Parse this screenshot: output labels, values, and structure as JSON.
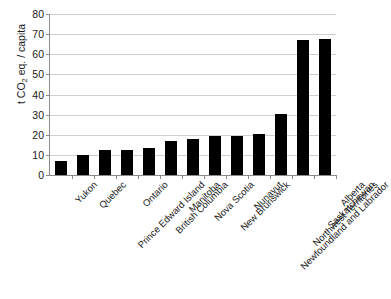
{
  "chart_data": {
    "type": "bar",
    "title": "",
    "subtitle": "",
    "xlabel": "",
    "ylabel": "t CO2 eq. / capita",
    "ylabel_parts": {
      "prefix": "t CO",
      "sub": "2",
      "suffix": " eq. / capita"
    },
    "ylim": [
      0,
      80
    ],
    "ytick_step": 10,
    "yticks": [
      80,
      70,
      60,
      50,
      40,
      30,
      20,
      10,
      0
    ],
    "ytick_labels": [
      "80",
      "70",
      "60",
      "50",
      "40",
      "30",
      "20",
      "10",
      "0"
    ],
    "grid": true,
    "grid_axis": "y",
    "legend": false,
    "legend_position": "none",
    "bar_color": "#000000",
    "grid_color": "#cfcfcf",
    "axis_color": "#8a8a8a",
    "categories": [
      "Yukon",
      "Quebec",
      "Prince Edward Island",
      "Ontario",
      "British Columbia",
      "Manitoba",
      "Nova Scotia",
      "New Brunswick",
      "Nunavut",
      "Newfoundland and Labrador",
      "Northwest Territories",
      "Saskatchewan",
      "Alberta"
    ],
    "values": [
      6.8,
      9.9,
      12.2,
      12.4,
      13.3,
      16.8,
      17.8,
      19.4,
      19.5,
      20.3,
      30.4,
      67.3,
      67.6
    ]
  }
}
